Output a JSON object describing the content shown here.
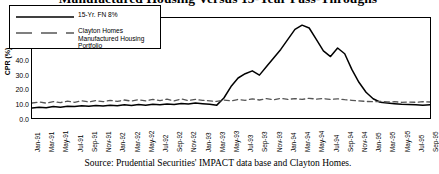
{
  "chart_data": {
    "type": "line",
    "title": "Manufactured Housing Versus 15-Year Pass-Throughs",
    "xlabel": "",
    "ylabel": "CPR (%)",
    "ylim": [
      0,
      70
    ],
    "ytick_labels": [
      "70.0",
      "60.0",
      "50.0",
      "40.0",
      "30.0",
      "20.0",
      "10.0",
      "0.0"
    ],
    "ytick_values": [
      70,
      60,
      50,
      40,
      30,
      20,
      10,
      0
    ],
    "grid": false,
    "legend_position": "top-left",
    "x": [
      "Jan-91",
      "Feb-91",
      "Mar-91",
      "Apr-91",
      "May-91",
      "Jun-91",
      "Jul-91",
      "Aug-91",
      "Sep-91",
      "Oct-91",
      "Nov-91",
      "Dec-91",
      "Jan-92",
      "Feb-92",
      "Mar-92",
      "Apr-92",
      "May-92",
      "Jun-92",
      "Jul-92",
      "Aug-92",
      "Sep-92",
      "Oct-92",
      "Nov-92",
      "Dec-92",
      "Jan-93",
      "Feb-93",
      "Mar-93",
      "Apr-93",
      "May-93",
      "Jun-93",
      "Jul-93",
      "Aug-93",
      "Sep-93",
      "Oct-93",
      "Nov-93",
      "Dec-93",
      "Jan-94",
      "Feb-94",
      "Mar-94",
      "Apr-94",
      "May-94",
      "Jun-94",
      "Jul-94",
      "Aug-94",
      "Sep-94",
      "Oct-94",
      "Nov-94",
      "Dec-94",
      "Jan-95",
      "Feb-95",
      "Mar-95",
      "Apr-95",
      "May-95",
      "Jun-95",
      "Jul-95",
      "Aug-95",
      "Sep-95"
    ],
    "xtick_labels": [
      "Jan-91",
      "Mar-91",
      "May-91",
      "Jul-91",
      "Sep-91",
      "Nov-91",
      "Jan-92",
      "Mar-92",
      "May-92",
      "Jul-92",
      "Sep-92",
      "Nov-92",
      "Jan-93",
      "Mar-93",
      "May-93",
      "Jul-93",
      "Sep-93",
      "Nov-93",
      "Jan-94",
      "Mar-94",
      "May-94",
      "Jul-94",
      "Sep-94",
      "Nov-94",
      "Jan-95",
      "Mar-95",
      "May-95",
      "Jul-95",
      "Sep-95"
    ],
    "series": [
      {
        "name": "15-Yr. FN 8%",
        "style": "solid",
        "color": "#000000",
        "values": [
          7.0,
          7.5,
          7.2,
          8.0,
          7.6,
          8.2,
          8.0,
          8.6,
          8.2,
          8.8,
          8.4,
          9.0,
          8.6,
          9.2,
          8.8,
          9.4,
          9.0,
          9.6,
          9.2,
          9.8,
          9.4,
          10.2,
          9.8,
          10.5,
          10.0,
          9.6,
          9.0,
          14.0,
          22.0,
          28.0,
          31.0,
          33.0,
          30.0,
          36.0,
          42.0,
          48.0,
          55.0,
          62.0,
          65.0,
          63.0,
          55.0,
          47.0,
          43.0,
          49.0,
          45.0,
          34.0,
          25.0,
          18.0,
          13.5,
          11.0,
          10.5,
          10.0,
          9.6,
          9.4,
          9.2,
          9.0,
          9.2
        ]
      },
      {
        "name": "Clayton Homes Manufactured Housing Portfolio",
        "style": "dashed",
        "color": "#555555",
        "values": [
          10.5,
          11.2,
          10.4,
          11.5,
          10.8,
          11.8,
          11.0,
          12.0,
          11.2,
          12.2,
          11.4,
          12.4,
          11.6,
          12.6,
          11.8,
          12.8,
          12.0,
          13.0,
          12.2,
          13.2,
          12.0,
          13.4,
          12.2,
          13.0,
          12.4,
          12.0,
          11.6,
          12.6,
          12.0,
          13.0,
          12.4,
          13.4,
          12.6,
          13.6,
          12.8,
          13.8,
          13.0,
          13.6,
          13.0,
          13.8,
          13.2,
          13.6,
          13.0,
          13.4,
          12.8,
          12.4,
          12.0,
          11.6,
          11.4,
          11.6,
          11.2,
          11.4,
          11.0,
          11.2,
          11.0,
          11.4,
          11.2
        ]
      }
    ],
    "source": "Source: Prudential Securities' IMPACT data base and Clayton Homes."
  }
}
